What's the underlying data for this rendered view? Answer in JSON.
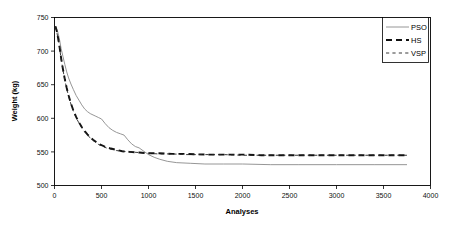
{
  "chart_data": {
    "type": "line",
    "title": "",
    "xlabel": "Analyses",
    "ylabel": "Weight (kg)",
    "xlim": [
      0,
      4000
    ],
    "ylim": [
      500,
      750
    ],
    "xticks": [
      0,
      500,
      1000,
      1500,
      2000,
      2500,
      3000,
      3500,
      4000
    ],
    "yticks": [
      500,
      550,
      600,
      650,
      700,
      750
    ],
    "xtick_labels": [
      "0",
      "500",
      "1000",
      "1500",
      "2000",
      "2500",
      "3000",
      "3500",
      "4000"
    ],
    "ytick_labels": [
      "500",
      "550",
      "600",
      "650",
      "700",
      "750"
    ],
    "grid": false,
    "legend_position": "top-right",
    "series": [
      {
        "name": "PSO",
        "style": "solid",
        "color": "#8a8a8a",
        "x": [
          10,
          25,
          40,
          55,
          70,
          90,
          110,
          130,
          150,
          175,
          200,
          230,
          260,
          290,
          320,
          350,
          380,
          410,
          440,
          470,
          500,
          540,
          580,
          620,
          660,
          700,
          740,
          780,
          820,
          860,
          900,
          950,
          1000,
          1060,
          1120,
          1200,
          1300,
          1450,
          1600,
          1800,
          2000,
          2300,
          2600,
          3000,
          3400,
          3750
        ],
        "y": [
          737,
          733,
          726,
          716,
          704,
          692,
          680,
          669,
          660,
          651,
          643,
          634,
          627,
          620,
          614,
          610,
          607,
          605,
          603,
          601,
          599,
          592,
          586,
          582,
          579,
          577,
          575,
          568,
          562,
          558,
          556,
          551,
          546,
          542,
          539,
          536,
          534,
          533,
          532,
          532,
          532,
          531,
          531,
          531,
          531,
          531
        ]
      },
      {
        "name": "HS",
        "style": "dashed-thick",
        "color": "#111111",
        "x": [
          10,
          25,
          40,
          55,
          70,
          90,
          110,
          130,
          150,
          175,
          200,
          230,
          260,
          290,
          320,
          350,
          380,
          410,
          440,
          470,
          500,
          550,
          600,
          660,
          720,
          800,
          900,
          1000,
          1100,
          1250,
          1400,
          1600,
          1800,
          2000,
          2200,
          2500,
          2800,
          3100,
          3400,
          3750
        ],
        "y": [
          737,
          729,
          718,
          705,
          690,
          673,
          658,
          645,
          634,
          622,
          612,
          602,
          594,
          587,
          581,
          576,
          572,
          568,
          565,
          562,
          560,
          557,
          555,
          553,
          551,
          550,
          549,
          548,
          548,
          547,
          547,
          546,
          546,
          546,
          545,
          545,
          545,
          545,
          545,
          545
        ]
      },
      {
        "name": "VSP",
        "style": "dashed-thin",
        "color": "#222222",
        "x": [
          10,
          25,
          40,
          55,
          70,
          90,
          110,
          130,
          150,
          175,
          200,
          230,
          260,
          290,
          320,
          350,
          380,
          410,
          440,
          470,
          500,
          550,
          600,
          660,
          720,
          800,
          900,
          1000,
          1100,
          1250,
          1400,
          1600,
          1800,
          2000,
          2200,
          2500,
          2800,
          3100,
          3400,
          3750
        ],
        "y": [
          736,
          728,
          717,
          704,
          689,
          672,
          657,
          644,
          633,
          621,
          611,
          601,
          593,
          586,
          580,
          575,
          571,
          567,
          564,
          561,
          559,
          556,
          554,
          552,
          551,
          550,
          549,
          548,
          547,
          547,
          546,
          546,
          546,
          545,
          545,
          545,
          545,
          545,
          545,
          545
        ]
      }
    ],
    "legend": [
      {
        "label": "PSO",
        "style": "solid"
      },
      {
        "label": "HS",
        "style": "dashed-thick"
      },
      {
        "label": "VSP",
        "style": "dashed-thin"
      }
    ]
  }
}
